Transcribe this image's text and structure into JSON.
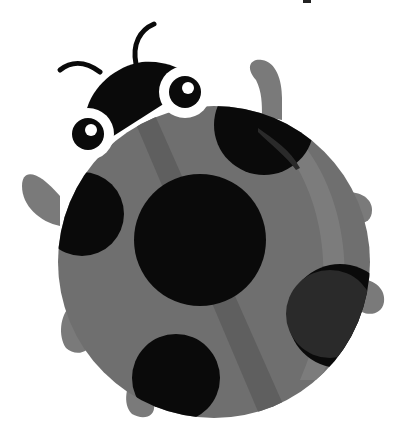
{
  "image": {
    "subject": "ladybug-illustration",
    "description": "Cartoon ladybug seen from above in grayscale, with black head, two antennae, two white-ringed eyes, gray round body with black spots and six gray legs",
    "colors": {
      "background": "#ffffff",
      "body": "#6f6f6f",
      "body_stripe": "#5f5f5f",
      "body_highlight": "#7c7c7c",
      "spots": "#0a0a0a",
      "spot_shade": "#2a2a2a",
      "head": "#0a0a0a",
      "legs": "#7a7a7a",
      "eye_ring": "#ffffff",
      "pupil": "#0a0a0a",
      "eye_glint": "#ffffff"
    },
    "parts": {
      "antennae": 2,
      "eyes": 2,
      "legs": 6,
      "spots": 5
    }
  }
}
